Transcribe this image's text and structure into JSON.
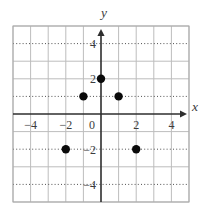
{
  "chart_data": {
    "type": "scatter",
    "title": "",
    "points": [
      [
        -2,
        -2
      ],
      [
        -1,
        1
      ],
      [
        0,
        2
      ],
      [
        1,
        1
      ],
      [
        2,
        -2
      ]
    ],
    "xlabel": "x",
    "ylabel": "y",
    "xlim": [
      -5,
      5
    ],
    "ylim": [
      -5,
      5
    ],
    "x_tick_labels": [
      -4,
      -2,
      0,
      2,
      4
    ],
    "y_tick_labels": [
      4,
      2,
      -2,
      -4
    ],
    "dotted_gridline_rows": [
      4,
      1,
      -2,
      -4
    ],
    "grid": true,
    "legend": false
  },
  "colors": {
    "background": "#ffffff",
    "grid": "#bdbdbd",
    "border": "#a9a9a9",
    "dotted_line": "#515151",
    "axis": "#2e2e2e",
    "point": "#0a0a0a",
    "label": "#3c3c3c"
  }
}
